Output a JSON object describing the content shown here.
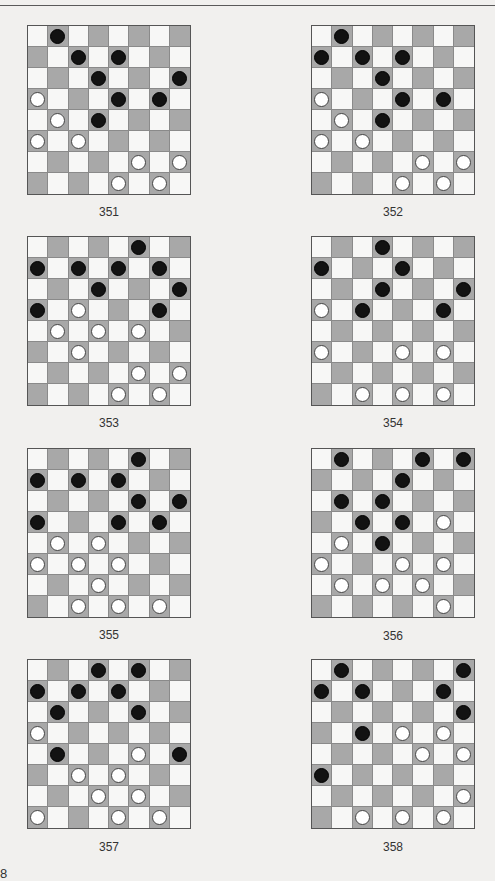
{
  "page": {
    "page_number_fragment": "8"
  },
  "colors": {
    "dark_square": "#a8a8a8",
    "light_square": "#f7f7f6",
    "black_piece": "#121212",
    "white_piece": "#ffffff"
  },
  "puzzles": [
    {
      "number": "351",
      "black": [
        [
          0,
          1
        ],
        [
          1,
          2
        ],
        [
          1,
          4
        ],
        [
          2,
          3
        ],
        [
          2,
          7
        ],
        [
          3,
          4
        ],
        [
          3,
          6
        ],
        [
          4,
          3
        ]
      ],
      "white": [
        [
          3,
          0
        ],
        [
          4,
          1
        ],
        [
          5,
          0
        ],
        [
          5,
          2
        ],
        [
          6,
          5
        ],
        [
          6,
          7
        ],
        [
          7,
          4
        ],
        [
          7,
          6
        ]
      ]
    },
    {
      "number": "352",
      "black": [
        [
          0,
          1
        ],
        [
          1,
          0
        ],
        [
          1,
          2
        ],
        [
          1,
          4
        ],
        [
          2,
          3
        ],
        [
          3,
          4
        ],
        [
          3,
          6
        ],
        [
          4,
          3
        ]
      ],
      "white": [
        [
          3,
          0
        ],
        [
          4,
          1
        ],
        [
          5,
          0
        ],
        [
          5,
          2
        ],
        [
          6,
          5
        ],
        [
          6,
          7
        ],
        [
          7,
          4
        ],
        [
          7,
          6
        ]
      ]
    },
    {
      "number": "353",
      "black": [
        [
          0,
          5
        ],
        [
          1,
          0
        ],
        [
          1,
          2
        ],
        [
          1,
          4
        ],
        [
          1,
          6
        ],
        [
          2,
          3
        ],
        [
          2,
          7
        ],
        [
          3,
          0
        ],
        [
          3,
          6
        ]
      ],
      "white": [
        [
          3,
          2
        ],
        [
          4,
          1
        ],
        [
          4,
          3
        ],
        [
          4,
          5
        ],
        [
          5,
          2
        ],
        [
          6,
          5
        ],
        [
          6,
          7
        ],
        [
          7,
          4
        ],
        [
          7,
          6
        ]
      ]
    },
    {
      "number": "354",
      "black": [
        [
          0,
          3
        ],
        [
          1,
          0
        ],
        [
          1,
          4
        ],
        [
          2,
          3
        ],
        [
          2,
          7
        ],
        [
          3,
          2
        ],
        [
          3,
          6
        ]
      ],
      "white": [
        [
          3,
          0
        ],
        [
          5,
          0
        ],
        [
          5,
          4
        ],
        [
          5,
          6
        ],
        [
          7,
          2
        ],
        [
          7,
          4
        ],
        [
          7,
          6
        ]
      ]
    },
    {
      "number": "355",
      "black": [
        [
          0,
          5
        ],
        [
          1,
          0
        ],
        [
          1,
          2
        ],
        [
          1,
          4
        ],
        [
          2,
          5
        ],
        [
          2,
          7
        ],
        [
          3,
          0
        ],
        [
          3,
          4
        ],
        [
          3,
          6
        ]
      ],
      "white": [
        [
          4,
          1
        ],
        [
          4,
          3
        ],
        [
          5,
          0
        ],
        [
          5,
          2
        ],
        [
          5,
          4
        ],
        [
          6,
          3
        ],
        [
          7,
          2
        ],
        [
          7,
          4
        ],
        [
          7,
          6
        ]
      ]
    },
    {
      "number": "356",
      "black": [
        [
          0,
          1
        ],
        [
          0,
          5
        ],
        [
          0,
          7
        ],
        [
          1,
          4
        ],
        [
          2,
          1
        ],
        [
          2,
          3
        ],
        [
          3,
          2
        ],
        [
          3,
          4
        ],
        [
          4,
          3
        ]
      ],
      "white": [
        [
          3,
          6
        ],
        [
          4,
          1
        ],
        [
          5,
          0
        ],
        [
          5,
          4
        ],
        [
          5,
          6
        ],
        [
          6,
          1
        ],
        [
          6,
          3
        ],
        [
          6,
          5
        ],
        [
          7,
          6
        ]
      ]
    },
    {
      "number": "357",
      "black": [
        [
          0,
          3
        ],
        [
          0,
          5
        ],
        [
          1,
          0
        ],
        [
          1,
          2
        ],
        [
          1,
          4
        ],
        [
          2,
          1
        ],
        [
          2,
          5
        ],
        [
          4,
          1
        ],
        [
          4,
          7
        ]
      ],
      "white": [
        [
          3,
          0
        ],
        [
          4,
          5
        ],
        [
          5,
          2
        ],
        [
          5,
          4
        ],
        [
          6,
          3
        ],
        [
          6,
          5
        ],
        [
          7,
          0
        ],
        [
          7,
          4
        ],
        [
          7,
          6
        ]
      ]
    },
    {
      "number": "358",
      "black": [
        [
          0,
          1
        ],
        [
          0,
          7
        ],
        [
          1,
          0
        ],
        [
          1,
          2
        ],
        [
          1,
          6
        ],
        [
          2,
          7
        ],
        [
          3,
          2
        ],
        [
          5,
          0
        ]
      ],
      "white": [
        [
          3,
          4
        ],
        [
          3,
          6
        ],
        [
          4,
          5
        ],
        [
          4,
          7
        ],
        [
          6,
          7
        ],
        [
          7,
          2
        ],
        [
          7,
          4
        ],
        [
          7,
          6
        ]
      ]
    }
  ]
}
